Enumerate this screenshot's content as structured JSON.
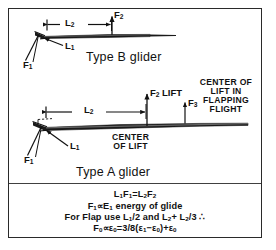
{
  "figure": {
    "kind": "engineering-diagram",
    "border_color": "#2a2a2a",
    "ink_color": "#111111"
  },
  "type_b": {
    "title": "Type B glider",
    "labels": {
      "f2": "F",
      "f2_sub": "2",
      "l2": "L",
      "l2_sub": "2",
      "l1": "L",
      "l1_sub": "1",
      "f1": "F",
      "f1_sub": "1"
    }
  },
  "type_a": {
    "title": "Type A glider",
    "labels": {
      "f2_lift": "LIFT",
      "f2": "F",
      "f2_sub": "2",
      "f3": "F",
      "f3_sub": "3",
      "l2": "L",
      "l2_sub": "2",
      "l1": "L",
      "l1_sub": "1",
      "f1": "F",
      "f1_sub": "1"
    },
    "center_of_lift": [
      "CENTER",
      "OF LIFT"
    ],
    "center_of_lift_flapping": [
      "CENTER OF",
      "LIFT IN",
      "FLAPPING",
      "FLIGHT"
    ]
  },
  "formulas": {
    "line1": {
      "parts": [
        "L",
        "1",
        "F",
        "1",
        "=L",
        "2",
        "F",
        "2"
      ]
    },
    "line1_plain": "L1F1=L2F2",
    "line2_plain": "F1∝E1 energy of glide",
    "line3_plain": "For Flap use L1/2 and L2+ L2/3 ∴",
    "line4_plain": "F0 ∝ ε0 = 3/8(ε1 − ε0) + ε0"
  }
}
